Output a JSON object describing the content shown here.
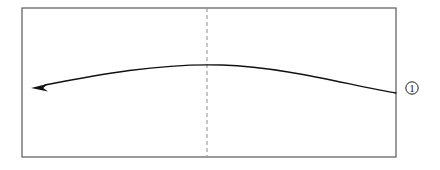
{
  "figure": {
    "title": "",
    "background_color": "#ffffff",
    "width": 440,
    "height": 170
  },
  "panel": {
    "name": "rectangular-frame",
    "stroke_color": "#4a4a4a",
    "stroke_width": 1.1,
    "fill": "#ffffff",
    "x": 22,
    "y": 8,
    "width": 374,
    "height": 149
  },
  "centerline": {
    "name": "dashed-centerline",
    "orientation": "vertical",
    "stroke_color": "#8c8c8c",
    "stroke_width": 1,
    "dash_pattern": "4 3",
    "x": 207,
    "y_top": 8,
    "y_bottom": 157
  },
  "curve": {
    "name": "arc-arrow",
    "stroke_color": "#111111",
    "stroke_width": 1.3,
    "direction": "right-to-left",
    "start_point": [
      396,
      93
    ],
    "apex_point": [
      222,
      65
    ],
    "end_point": [
      33,
      88
    ],
    "path": "M 396 93 C 352 86, 286 67, 222 65 C 160 63, 96 75, 45 85",
    "arrowhead": {
      "name": "arrowhead-left",
      "style": "solid-filled-triangle",
      "tip": [
        31,
        88
      ],
      "length": 17,
      "half_width": 4.2,
      "fill": "#111111"
    }
  },
  "annotations": [
    {
      "name": "callout-marker-1",
      "label": "1",
      "display": "①",
      "shape": "circle",
      "cx": 412,
      "cy": 88,
      "r": 6.2,
      "stroke_color": "#1a1a1a",
      "text_color": "#1a1a1a",
      "font_size": 11
    }
  ]
}
